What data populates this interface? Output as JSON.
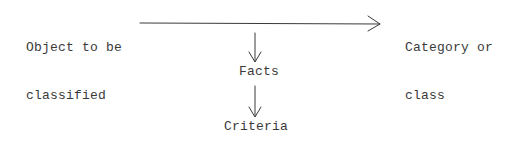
{
  "diagram": {
    "type": "flow",
    "nodes": {
      "object": {
        "line1": "Object to be",
        "line2": "classified"
      },
      "category": {
        "line1": "Category or",
        "line2": "class"
      },
      "facts": {
        "label": "Facts"
      },
      "criteria": {
        "label": "Criteria"
      }
    },
    "edges": [
      {
        "from": "object",
        "to": "category",
        "direction": "right"
      },
      {
        "from": "main-arrow",
        "to": "facts",
        "direction": "down"
      },
      {
        "from": "facts",
        "to": "criteria",
        "direction": "down"
      }
    ],
    "colors": {
      "ink": "#3a3a3a",
      "background": "#ffffff"
    }
  }
}
